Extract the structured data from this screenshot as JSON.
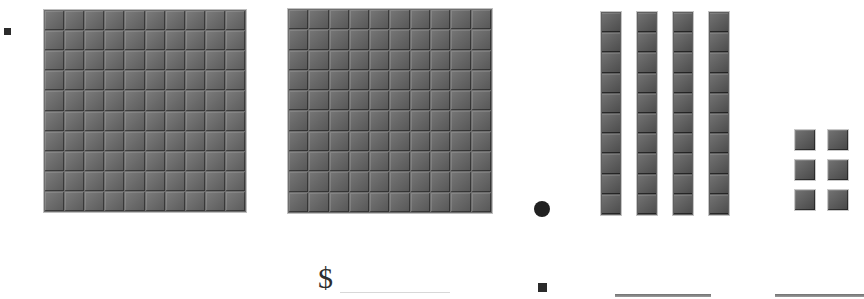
{
  "worksheet": {
    "type": "base-ten-blocks-decimal",
    "represented_value": "2.46",
    "currency_symbol": "$",
    "bullet_marker": "■",
    "decimal_point_marker": "●"
  },
  "blocks": {
    "flats": {
      "label": "hundred-flat",
      "count": 2,
      "rows": 10,
      "columns": 10,
      "units_each": 100,
      "place_value": "ones",
      "items": [
        {
          "name": "flat-1",
          "x": 44,
          "y": 10,
          "size": 202
        },
        {
          "name": "flat-2",
          "x": 288,
          "y": 9,
          "size": 204
        }
      ]
    },
    "rods": {
      "label": "ten-rod",
      "count": 4,
      "segments_each": 10,
      "place_value": "tenths",
      "items": [
        {
          "name": "rod-1",
          "x": 601,
          "y": 12,
          "width": 20,
          "height": 203
        },
        {
          "name": "rod-2",
          "x": 637,
          "y": 12,
          "width": 20,
          "height": 203
        },
        {
          "name": "rod-3",
          "x": 673,
          "y": 12,
          "width": 20,
          "height": 203
        },
        {
          "name": "rod-4",
          "x": 709,
          "y": 12,
          "width": 20,
          "height": 203
        }
      ]
    },
    "units": {
      "label": "unit-cube",
      "count": 6,
      "rows": 3,
      "columns": 2,
      "place_value": "hundredths",
      "items": [
        {
          "name": "unit-1",
          "x": 795,
          "y": 130,
          "size": 20
        },
        {
          "name": "unit-2",
          "x": 828,
          "y": 130,
          "size": 20
        },
        {
          "name": "unit-3",
          "x": 795,
          "y": 160,
          "size": 20
        },
        {
          "name": "unit-4",
          "x": 828,
          "y": 160,
          "size": 20
        },
        {
          "name": "unit-5",
          "x": 795,
          "y": 190,
          "size": 20
        },
        {
          "name": "unit-6",
          "x": 828,
          "y": 190,
          "size": 20
        }
      ]
    }
  },
  "markers": {
    "top_left_bullet": {
      "x": 4,
      "y": 28,
      "size": 7
    },
    "bottom_bullet": {
      "x": 538,
      "y": 283,
      "size": 9
    },
    "decimal_dot": {
      "x": 534,
      "y": 201,
      "size": 16
    }
  },
  "answers": {
    "currency_blank": {
      "x": 340,
      "y": 292,
      "width": 110
    },
    "blank_1": {
      "x": 615,
      "y": 294,
      "width": 96
    },
    "blank_2": {
      "x": 775,
      "y": 294,
      "width": 89
    }
  },
  "colors": {
    "background": "#ffffff",
    "block_fill": "#6b6b6b",
    "block_outline": "#c4c4c4",
    "ink": "#2e2e2e",
    "rule_faint": "#d8d8d8",
    "rule": "#808080"
  }
}
